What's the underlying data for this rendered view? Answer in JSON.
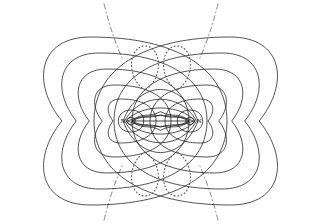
{
  "figure": {
    "name": "nitrogen-molecule-contour-map",
    "kind": "contour-plot",
    "background_color": "#ffffff",
    "line_color": "#1a1a1a",
    "width": 320,
    "height": 224
  },
  "atoms": [
    {
      "label": "N",
      "label_x": 123,
      "label_y": 120,
      "nucleus_x": 131,
      "nucleus_y": 121,
      "nucleus_rx": 4.2,
      "nucleus_ry": 3.4
    },
    {
      "label": "N",
      "label_x": 199,
      "label_y": 120,
      "nucleus_x": 190,
      "nucleus_y": 121,
      "nucleus_rx": 4.2,
      "nucleus_ry": 3.4
    }
  ],
  "bond_axis": {
    "x1": 131,
    "y1": 121,
    "x2": 190,
    "y2": 121
  },
  "chart_data": {
    "type": "contour",
    "title": "",
    "xlabel": "",
    "ylabel": "",
    "grid": false,
    "legend": "none",
    "center_y": 121,
    "left_center_x": 131,
    "right_center_x": 190,
    "solid_atomic_contours": [
      {
        "level": 1,
        "rx": 13,
        "ry": 11
      },
      {
        "level": 2,
        "rx": 25,
        "ry": 22
      },
      {
        "level": 3,
        "rx": 40,
        "ry": 36
      },
      {
        "level": 4,
        "rx": 58,
        "ry": 52
      },
      {
        "level": 5,
        "rx": 76,
        "ry": 68
      },
      {
        "level": 6,
        "rx": 96,
        "ry": 84
      }
    ],
    "bond_lens_contours": [
      {
        "level": 1,
        "half_height": 5
      },
      {
        "level": 2,
        "half_height": 12
      },
      {
        "level": 3,
        "half_height": 20
      },
      {
        "level": 4,
        "half_height": 29
      }
    ],
    "wavy_inner_contours": 2,
    "dotted_lobes": [
      {
        "position": "upper-left",
        "cx": 145,
        "cy": 68,
        "rx": 13,
        "ry": 22
      },
      {
        "position": "upper-right",
        "cx": 177,
        "cy": 68,
        "rx": 13,
        "ry": 22
      },
      {
        "position": "lower-left",
        "cx": 145,
        "cy": 174,
        "rx": 13,
        "ry": 22
      },
      {
        "position": "lower-right",
        "cx": 177,
        "cy": 174,
        "rx": 13,
        "ry": 22
      }
    ],
    "dashdot_asymptotes": [
      {
        "position": "top-left",
        "x1": 104,
        "y1": 4,
        "x2": 123,
        "y2": 60
      },
      {
        "position": "top-right",
        "x1": 218,
        "y1": 4,
        "x2": 199,
        "y2": 60
      },
      {
        "position": "bottom-left",
        "x1": 104,
        "y1": 220,
        "x2": 123,
        "y2": 164
      },
      {
        "position": "bottom-right",
        "x1": 218,
        "y1": 220,
        "x2": 199,
        "y2": 164
      }
    ]
  }
}
